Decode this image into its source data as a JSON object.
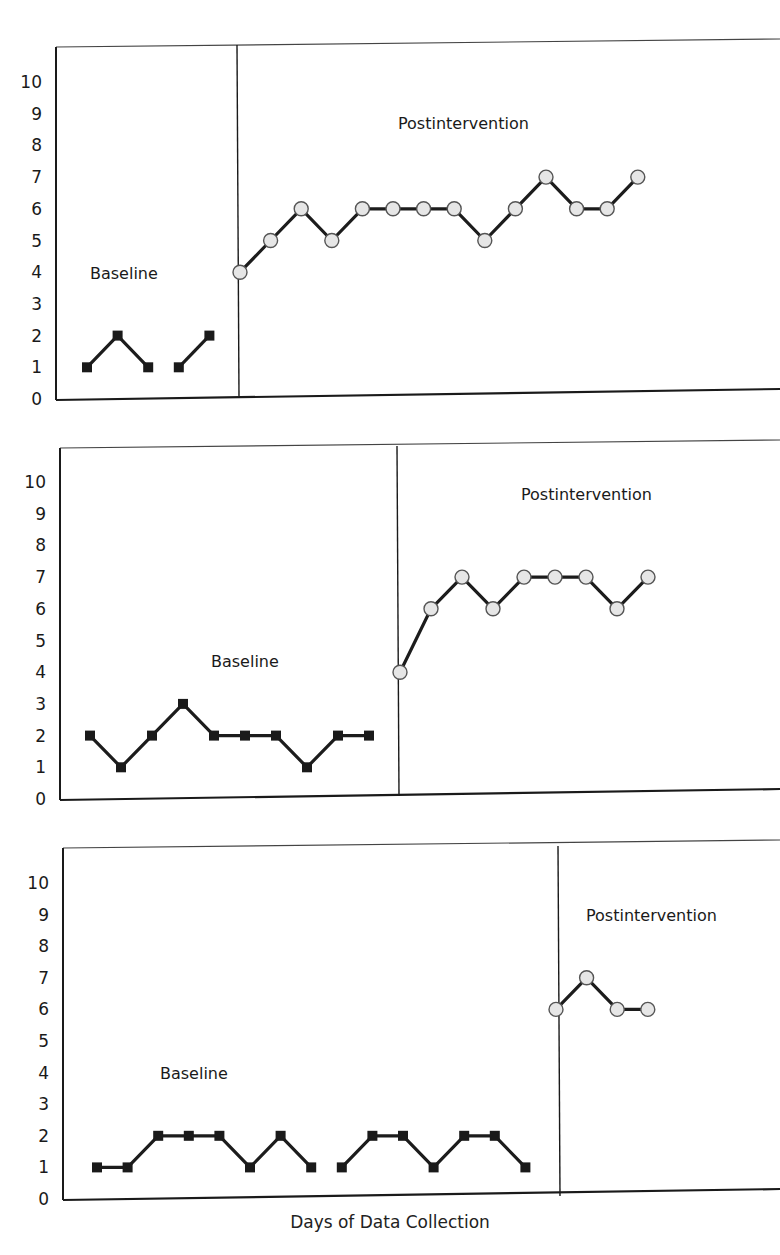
{
  "chart_data": {
    "type": "line",
    "title": "",
    "xlabel": "Days of Data Collection",
    "ylabel": "",
    "ylim": [
      0,
      10
    ],
    "yticks": [
      0,
      1,
      2,
      3,
      4,
      5,
      6,
      7,
      8,
      9,
      10
    ],
    "grid": false,
    "legend": null,
    "panels": [
      {
        "id": 1,
        "phases": [
          {
            "name": "Baseline",
            "marker": "square",
            "segments": [
              {
                "days": [
                  1,
                  2,
                  3
                ],
                "values": [
                  1,
                  2,
                  1
                ]
              },
              {
                "days": [
                  4,
                  5
                ],
                "values": [
                  1,
                  2
                ]
              }
            ]
          },
          {
            "name": "Postintervention",
            "marker": "circle",
            "segments": [
              {
                "days": [
                  6,
                  7,
                  8,
                  9,
                  10,
                  11,
                  12,
                  13,
                  14,
                  15,
                  16,
                  17,
                  18,
                  19
                ],
                "values": [
                  4,
                  5,
                  6,
                  5,
                  6,
                  6,
                  6,
                  6,
                  5,
                  6,
                  7,
                  6,
                  6,
                  7
                ]
              }
            ]
          }
        ]
      },
      {
        "id": 2,
        "phases": [
          {
            "name": "Baseline",
            "marker": "square",
            "segments": [
              {
                "days": [
                  1,
                  2,
                  3,
                  4,
                  5,
                  6,
                  7,
                  8,
                  9,
                  10
                ],
                "values": [
                  2,
                  1,
                  2,
                  3,
                  2,
                  2,
                  2,
                  1,
                  2,
                  2
                ]
              }
            ]
          },
          {
            "name": "Postintervention",
            "marker": "circle",
            "segments": [
              {
                "days": [
                  11,
                  12,
                  13,
                  14,
                  15,
                  16,
                  17,
                  18,
                  19
                ],
                "values": [
                  4,
                  6,
                  7,
                  6,
                  7,
                  7,
                  7,
                  6,
                  7
                ]
              }
            ]
          }
        ]
      },
      {
        "id": 3,
        "phases": [
          {
            "name": "Baseline",
            "marker": "square",
            "segments": [
              {
                "days": [
                  1,
                  2,
                  3,
                  4,
                  5,
                  6,
                  7,
                  8
                ],
                "values": [
                  1,
                  1,
                  2,
                  2,
                  2,
                  1,
                  2,
                  1
                ]
              },
              {
                "days": [
                  9,
                  10,
                  11,
                  12,
                  13,
                  14,
                  15
                ],
                "values": [
                  1,
                  2,
                  2,
                  1,
                  2,
                  2,
                  1
                ]
              }
            ]
          },
          {
            "name": "Postintervention",
            "marker": "circle",
            "segments": [
              {
                "days": [
                  16,
                  17,
                  18,
                  19
                ],
                "values": [
                  6,
                  7,
                  6,
                  6
                ]
              }
            ]
          }
        ]
      }
    ]
  },
  "layout": {
    "panels": [
      {
        "left": 56,
        "right": 780,
        "top": 47,
        "y0": 399,
        "y10": 82,
        "phase_x": 239,
        "x_first": 87,
        "x_step": 30.6,
        "labels": [
          {
            "text": "Baseline",
            "x": 90,
            "y": 279
          },
          {
            "text": "Postintervention",
            "x": 398,
            "y": 129
          }
        ]
      },
      {
        "left": 60,
        "right": 780,
        "top": 448,
        "y0": 799,
        "y10": 482,
        "phase_x": 399,
        "x_first": 90,
        "x_step": 31.0,
        "labels": [
          {
            "text": "Baseline",
            "x": 211,
            "y": 667
          },
          {
            "text": "Postintervention",
            "x": 521,
            "y": 500
          }
        ]
      },
      {
        "left": 63,
        "right": 780,
        "top": 848,
        "y0": 1199,
        "y10": 883,
        "phase_x": 560,
        "x_first": 97,
        "x_step": 30.6,
        "labels": [
          {
            "text": "Baseline",
            "x": 160,
            "y": 1079
          },
          {
            "text": "Postintervention",
            "x": 586,
            "y": 921
          }
        ]
      }
    ],
    "colors": {
      "axis": "#1a1a1a",
      "line": "#1c1c1c",
      "square_fill": "#1a1a1a",
      "circle_fill": "#e6e6e6",
      "circle_stroke": "#555555"
    }
  },
  "axis": {
    "xlabel": "Days of Data Collection"
  }
}
